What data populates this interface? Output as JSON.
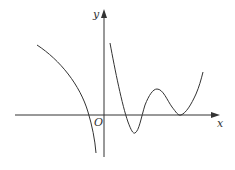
{
  "diagram": {
    "type": "function-graph",
    "axes": {
      "x_label": "x",
      "y_label": "y",
      "origin_label": "O"
    },
    "colors": {
      "stroke": "#333333",
      "background": "#ffffff"
    },
    "curves": [
      {
        "name": "left-branch",
        "description": "decreasing branch left of y-axis, crosses x-axis, tends to -infinity near asymptote"
      },
      {
        "name": "right-branch",
        "description": "decreasing from top near y-axis, local min below x-axis, local max above, local min tangent to x-axis, then increasing"
      }
    ]
  }
}
